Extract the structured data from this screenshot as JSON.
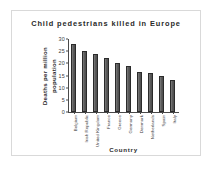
{
  "chart_data": {
    "type": "bar",
    "title": "Child  pedestrians  killed  in  Europe",
    "xlabel": "Country",
    "ylabel": "Deaths per million population",
    "ylabel_line1": "Deaths per million",
    "ylabel_line2": "population",
    "categories": [
      "Belgium",
      "Irish Republic",
      "United Kingdom",
      "France",
      "Greece",
      "Germany",
      "Denmark",
      "Netherlands",
      "Spain",
      "Italy"
    ],
    "values": [
      28,
      25,
      24,
      22,
      20,
      19,
      16.5,
      16,
      15,
      13
    ],
    "ylim": [
      0,
      30
    ],
    "yticks": [
      0,
      5,
      10,
      15,
      20,
      25,
      30
    ],
    "ytick_labels": [
      "0",
      "5",
      "10",
      "15",
      "20",
      "25",
      "30"
    ],
    "grid": false,
    "legend": "none",
    "bar_color": "#5f5f5f",
    "bar_edge_color": "#2b2b2b",
    "axis_color": "#4a4a4a",
    "text_color": "#2a2a2a",
    "background": "#ffffff",
    "frame_color": "#d9d9d9"
  }
}
